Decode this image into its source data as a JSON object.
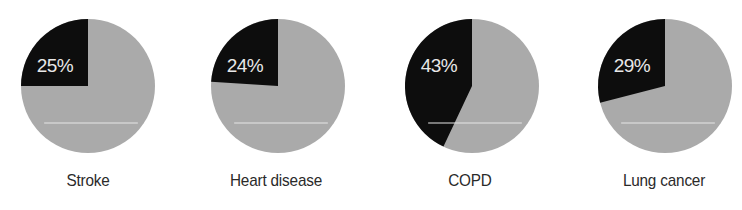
{
  "chart_data": {
    "type": "pie",
    "title": "",
    "charts": [
      {
        "label": "Stroke",
        "value": 25,
        "value_label": "25%"
      },
      {
        "label": "Heart disease",
        "value": 24,
        "value_label": "24%"
      },
      {
        "label": "COPD",
        "value": 43,
        "value_label": "43%"
      },
      {
        "label": "Lung cancer",
        "value": 29,
        "value_label": "29%"
      }
    ],
    "colors": {
      "highlight": "#0d0d0d",
      "remainder": "#aaaaaa",
      "text_in_slice": "#e8e8e8",
      "label": "#2a2a2a"
    },
    "legend": "none",
    "grid": false
  },
  "pies": [
    {
      "label": "Stroke",
      "pct": "25%"
    },
    {
      "label": "Heart disease",
      "pct": "24%"
    },
    {
      "label": "COPD",
      "pct": "43%"
    },
    {
      "label": "Lung cancer",
      "pct": "29%"
    }
  ]
}
